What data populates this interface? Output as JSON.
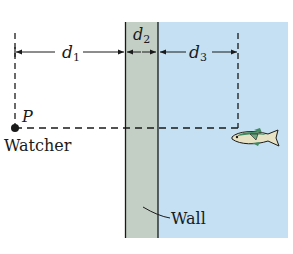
{
  "labels": {
    "d1": "d",
    "d1_sub": "1",
    "d2": "d",
    "d2_sub": "2",
    "d3": "d",
    "d3_sub": "3",
    "point": "P",
    "watcher": "Watcher",
    "wall": "Wall"
  },
  "colors": {
    "wall_fill": "#c3cfc4",
    "water_fill": "#c4e0f2",
    "line": "#1a1a1a",
    "fish_body": "#e8e2c4",
    "fish_back": "#3f8a63"
  }
}
